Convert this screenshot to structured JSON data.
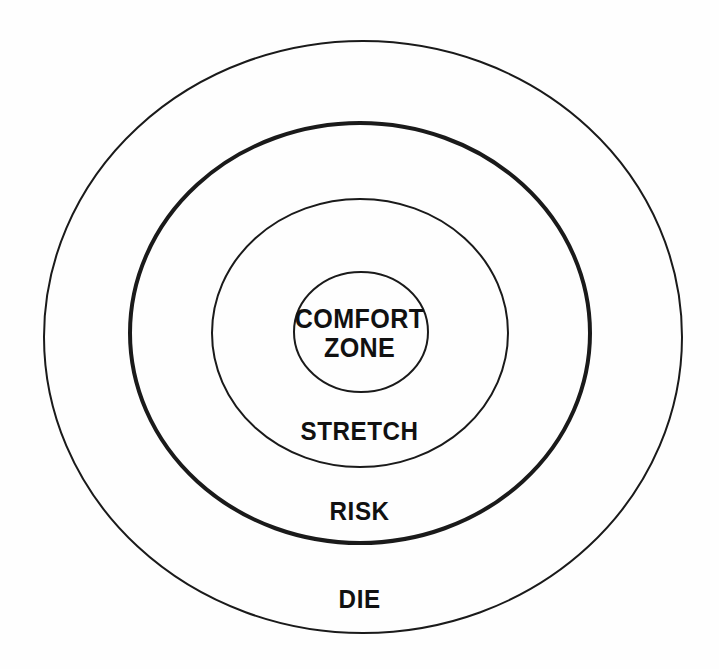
{
  "diagram": {
    "type": "concentric-zone-diagram",
    "background_color": "#fefefe",
    "stroke_color": "#1a1a1a",
    "text_color": "#111111",
    "center": {
      "x": 361,
      "y": 333
    },
    "zones": [
      {
        "id": "comfort-zone",
        "label": "COMFORT\nZONE",
        "level": 1,
        "rx": 67,
        "ry": 60,
        "cx": 361,
        "cy": 332,
        "stroke_width": 2,
        "emphasis": "normal",
        "label_x": 361,
        "label_y": 333
      },
      {
        "id": "stretch",
        "label": "STRETCH",
        "level": 2,
        "rx": 148,
        "ry": 134,
        "cx": 360,
        "cy": 333,
        "stroke_width": 2,
        "emphasis": "normal",
        "label_x": 361,
        "label_y": 432
      },
      {
        "id": "risk",
        "label": "RISK",
        "level": 3,
        "rx": 230,
        "ry": 210,
        "cx": 360,
        "cy": 333,
        "stroke_width": 4,
        "emphasis": "bold",
        "label_x": 361,
        "label_y": 512
      },
      {
        "id": "die",
        "label": "DIE",
        "level": 4,
        "rx": 319,
        "ry": 296,
        "cx": 363,
        "cy": 337,
        "stroke_width": 2,
        "emphasis": "normal",
        "label_x": 361,
        "label_y": 600
      }
    ]
  }
}
